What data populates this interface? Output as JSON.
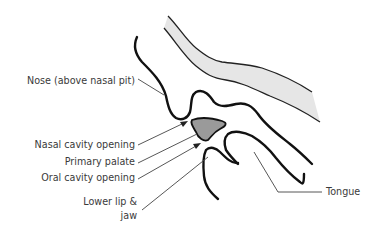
{
  "diagram": {
    "type": "anatomical-illustration",
    "colors": {
      "outline": "#111111",
      "leader": "#444444",
      "band_fill": "#e6e6e6",
      "palate_fill": "#9a9a9a",
      "text": "#3a3a3a"
    },
    "labels": {
      "nose": "Nose (above nasal pit)",
      "nasal_cavity_opening": "Nasal cavity opening",
      "primary_palate": "Primary palate",
      "oral_cavity_opening": "Oral cavity opening",
      "lower_lip_line1": "Lower lip &",
      "lower_lip_line2": "jaw",
      "tongue": "Tongue"
    }
  }
}
